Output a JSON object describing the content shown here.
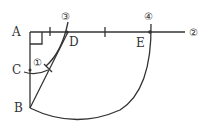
{
  "diagram": {
    "points": {
      "A": {
        "label": "A",
        "x": 30,
        "y": 32
      },
      "B": {
        "label": "B",
        "x": 30,
        "y": 108
      },
      "C": {
        "label": "C",
        "x": 30,
        "y": 70
      },
      "D": {
        "label": "D",
        "x": 67,
        "y": 32
      },
      "E": {
        "label": "E",
        "x": 150,
        "y": 32
      }
    },
    "step_markers": {
      "step1": "①",
      "step2": "②",
      "step3": "③",
      "step4": "④"
    },
    "colors": {
      "stroke": "#333333",
      "background": "#ffffff"
    }
  }
}
